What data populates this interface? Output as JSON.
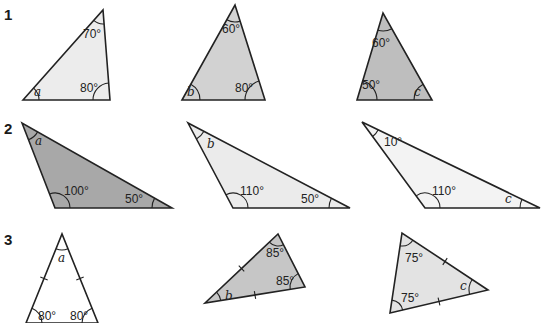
{
  "rows": [
    {
      "label": "1",
      "triangles": [
        {
          "id": "1a",
          "fill": "#ececec",
          "angles": [
            {
              "text": "a",
              "type": "var"
            },
            {
              "text": "70°",
              "type": "value"
            },
            {
              "text": "80°",
              "type": "value"
            }
          ],
          "equal_sides": 0
        },
        {
          "id": "1b",
          "fill": "#d2d2d2",
          "angles": [
            {
              "text": "b",
              "type": "var"
            },
            {
              "text": "60°",
              "type": "value"
            },
            {
              "text": "80°",
              "type": "value"
            }
          ],
          "equal_sides": 0
        },
        {
          "id": "1c",
          "fill": "#bebebe",
          "angles": [
            {
              "text": "50°",
              "type": "value"
            },
            {
              "text": "60°",
              "type": "value"
            },
            {
              "text": "c",
              "type": "var"
            }
          ],
          "equal_sides": 0
        }
      ]
    },
    {
      "label": "2",
      "triangles": [
        {
          "id": "2a",
          "fill": "#a8a8a8",
          "angles": [
            {
              "text": "a",
              "type": "var"
            },
            {
              "text": "100°",
              "type": "value"
            },
            {
              "text": "50°",
              "type": "value"
            }
          ],
          "equal_sides": 0
        },
        {
          "id": "2b",
          "fill": "#ebebeb",
          "angles": [
            {
              "text": "b",
              "type": "var"
            },
            {
              "text": "110°",
              "type": "value"
            },
            {
              "text": "50°",
              "type": "value"
            }
          ],
          "equal_sides": 0
        },
        {
          "id": "2c",
          "fill": "#f3f3f3",
          "angles": [
            {
              "text": "10°",
              "type": "value"
            },
            {
              "text": "110°",
              "type": "value"
            },
            {
              "text": "c",
              "type": "var"
            }
          ],
          "equal_sides": 0
        }
      ]
    },
    {
      "label": "3",
      "triangles": [
        {
          "id": "3a",
          "fill": "#ffffff",
          "angles": [
            {
              "text": "80°",
              "type": "value"
            },
            {
              "text": "a",
              "type": "var"
            },
            {
              "text": "80°",
              "type": "value"
            }
          ],
          "equal_sides": 2
        },
        {
          "id": "3b",
          "fill": "#c6c6c6",
          "angles": [
            {
              "text": "b",
              "type": "var"
            },
            {
              "text": "85°",
              "type": "value"
            },
            {
              "text": "85°",
              "type": "value"
            }
          ],
          "equal_sides": 2
        },
        {
          "id": "3c",
          "fill": "#e3e3e3",
          "angles": [
            {
              "text": "75°",
              "type": "value"
            },
            {
              "text": "75°",
              "type": "value"
            },
            {
              "text": "c",
              "type": "var"
            }
          ],
          "equal_sides": 2
        }
      ]
    }
  ]
}
